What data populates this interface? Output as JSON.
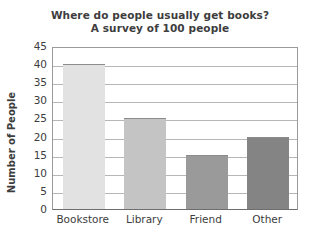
{
  "chart_data": {
    "type": "bar",
    "title": "Where do people usually get books?",
    "subtitle": "A survey of 100 people",
    "xlabel": "",
    "ylabel": "Number of People",
    "categories": [
      "Bookstore",
      "Library",
      "Friend",
      "Other"
    ],
    "values": [
      40,
      25,
      15,
      20
    ],
    "bar_colors": [
      "#e2e2e2",
      "#c4c4c4",
      "#9a9a9a",
      "#848484"
    ],
    "bar_edge_color": "#8c8c8c",
    "ylim": [
      0,
      45
    ],
    "ytick_labels": [
      "45",
      "40",
      "35",
      "30",
      "25",
      "20",
      "15",
      "10",
      "5",
      "0"
    ],
    "ytick_values": [
      45,
      40,
      35,
      30,
      25,
      20,
      15,
      10,
      5,
      0
    ],
    "grid": true,
    "grid_axis": "y",
    "legend": "none",
    "frame_color": "#9b9b9b",
    "axis_color": "#6e6e6e",
    "text_color": "#3d3d3d",
    "background": "#ffffff"
  }
}
